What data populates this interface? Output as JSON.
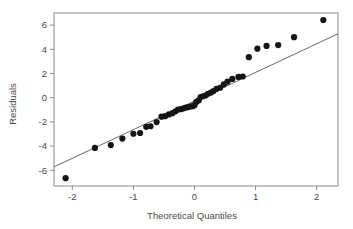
{
  "chart_data": {
    "type": "scatter",
    "title": "",
    "xlabel": "Theoretical Quantiles",
    "ylabel": "Residuals",
    "xlim": [
      -2.3,
      2.35
    ],
    "ylim": [
      -7.3,
      7.0
    ],
    "grid": false,
    "legend": false,
    "xticks": [
      -2,
      -1,
      0,
      1,
      2
    ],
    "xticklabels": [
      "-2",
      "-1",
      "0",
      "1",
      "2"
    ],
    "yticks": [
      -6,
      -4,
      -2,
      0,
      2,
      4,
      6
    ],
    "yticklabels": [
      "-6",
      "-4",
      "-2",
      "0",
      "2",
      "4",
      "6"
    ],
    "point_color": "#141414",
    "line_color": "#6b6b6b",
    "frame_color": "#8a8a8a",
    "marker_radius_px": 3.1,
    "reference_line": {
      "name": "qq-reference-line",
      "x": [
        -2.3,
        2.35
      ],
      "y": [
        -5.72,
        5.28
      ]
    },
    "series": [
      {
        "name": "residual-quantiles",
        "points": [
          [
            -2.11,
            -6.65
          ],
          [
            -1.63,
            -4.15
          ],
          [
            -1.37,
            -3.92
          ],
          [
            -1.18,
            -3.38
          ],
          [
            -1.0,
            -2.98
          ],
          [
            -0.89,
            -2.92
          ],
          [
            -0.79,
            -2.41
          ],
          [
            -0.72,
            -2.36
          ],
          [
            -0.62,
            -2.02
          ],
          [
            -0.54,
            -1.57
          ],
          [
            -0.48,
            -1.53
          ],
          [
            -0.42,
            -1.38
          ],
          [
            -0.36,
            -1.28
          ],
          [
            -0.31,
            -1.12
          ],
          [
            -0.27,
            -0.98
          ],
          [
            -0.22,
            -0.95
          ],
          [
            -0.18,
            -0.88
          ],
          [
            -0.14,
            -0.82
          ],
          [
            -0.1,
            -0.78
          ],
          [
            -0.07,
            -0.73
          ],
          [
            -0.03,
            -0.7
          ],
          [
            0.0,
            -0.62
          ],
          [
            0.03,
            -0.35
          ],
          [
            0.07,
            -0.22
          ],
          [
            0.1,
            0.05
          ],
          [
            0.14,
            0.12
          ],
          [
            0.18,
            0.18
          ],
          [
            0.22,
            0.32
          ],
          [
            0.27,
            0.42
          ],
          [
            0.31,
            0.55
          ],
          [
            0.36,
            0.72
          ],
          [
            0.42,
            0.82
          ],
          [
            0.48,
            1.1
          ],
          [
            0.54,
            1.32
          ],
          [
            0.62,
            1.55
          ],
          [
            0.72,
            1.72
          ],
          [
            0.79,
            1.75
          ],
          [
            0.89,
            3.35
          ],
          [
            1.03,
            4.05
          ],
          [
            1.18,
            4.28
          ],
          [
            1.37,
            4.35
          ],
          [
            1.63,
            5.0
          ],
          [
            2.11,
            6.42
          ]
        ]
      }
    ]
  },
  "axis": {
    "x_title": "Theoretical Quantiles",
    "y_title": "Residuals"
  }
}
